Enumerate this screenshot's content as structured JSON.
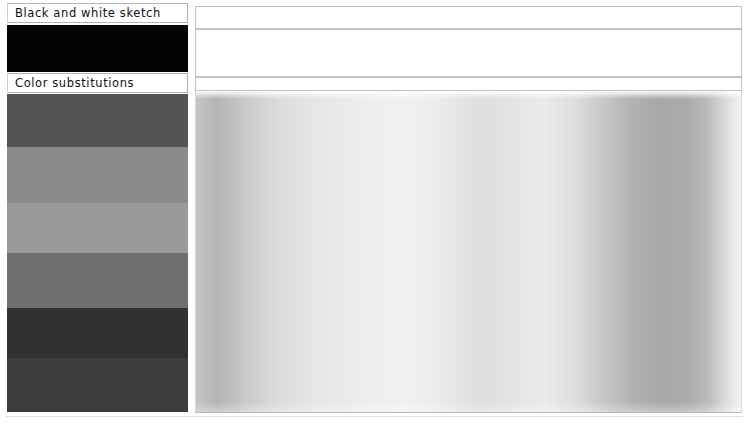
{
  "page": {
    "width": 745,
    "height": 424,
    "background": "#ffffff"
  },
  "left_column": {
    "name": "color-reference-column",
    "rows": [
      {
        "kind": "label",
        "label": "Black and white sketch",
        "top": 3,
        "height": 20,
        "background": "#ffffff",
        "text_color": "#111111"
      },
      {
        "kind": "swatch",
        "label": "black-swatch",
        "top": 25,
        "height": 47,
        "color": "#030303"
      },
      {
        "kind": "label",
        "label": "Color substitutions",
        "top": 73,
        "height": 20,
        "background": "#ffffff",
        "text_color": "#111111"
      }
    ],
    "bands": [
      {
        "name": "band-1-dark-gray",
        "top": 94,
        "height": 53,
        "color": "#545454"
      },
      {
        "name": "band-2-mid-gray",
        "top": 147,
        "height": 56,
        "color": "#8b8b8b"
      },
      {
        "name": "band-3-light-gray",
        "top": 203,
        "height": 50,
        "color": "#9a9a9a"
      },
      {
        "name": "band-4-medium-gray",
        "top": 253,
        "height": 55,
        "color": "#6f6f6f"
      },
      {
        "name": "band-5-very-dark-gray",
        "top": 308,
        "height": 50,
        "color": "#313131"
      },
      {
        "name": "band-6-dark-charcoal",
        "top": 358,
        "height": 54,
        "color": "#3d3d3d"
      }
    ]
  },
  "right_column": {
    "name": "preview-panel",
    "white_boxes": [
      {
        "name": "white-box-top",
        "top": 6,
        "height": 23,
        "fill": "#ffffff",
        "border": "#c2c2c2"
      },
      {
        "name": "white-box-middle",
        "top": 29,
        "height": 48,
        "fill": "#ffffff",
        "border": "#c2c2c2"
      },
      {
        "name": "white-box-lower",
        "top": 77,
        "height": 14,
        "fill": "#ffffff",
        "border": "#c2c2c2"
      }
    ],
    "gradient_panel": {
      "name": "grayscale-gradient-preview",
      "top": 91,
      "height": 322,
      "orientation": "horizontal",
      "stops": [
        {
          "pos": 0,
          "color": "#c4c4c4"
        },
        {
          "pos": 4,
          "color": "#b4b4b4"
        },
        {
          "pos": 9,
          "color": "#c9c9c9"
        },
        {
          "pos": 15,
          "color": "#dcdcdc"
        },
        {
          "pos": 22,
          "color": "#e6e6e6"
        },
        {
          "pos": 30,
          "color": "#ededed"
        },
        {
          "pos": 38,
          "color": "#f1f1f1"
        },
        {
          "pos": 45,
          "color": "#ebebeb"
        },
        {
          "pos": 52,
          "color": "#dddddd"
        },
        {
          "pos": 58,
          "color": "#e4e4e4"
        },
        {
          "pos": 64,
          "color": "#ebebeb"
        },
        {
          "pos": 70,
          "color": "#dcdcdc"
        },
        {
          "pos": 75,
          "color": "#c6c6c6"
        },
        {
          "pos": 80,
          "color": "#b2b2b2"
        },
        {
          "pos": 85,
          "color": "#a8a8a8"
        },
        {
          "pos": 90,
          "color": "#ababab"
        },
        {
          "pos": 94,
          "color": "#bcbcbc"
        },
        {
          "pos": 97,
          "color": "#dadada"
        },
        {
          "pos": 100,
          "color": "#f3f3f3"
        }
      ]
    }
  },
  "frame": {
    "bottom_rule_color": "#dedede"
  }
}
